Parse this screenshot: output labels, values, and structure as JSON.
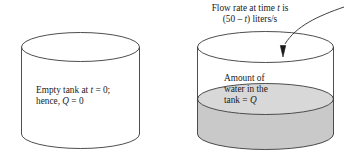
{
  "figure": {
    "kind": "diagram",
    "background_color": "#ffffff",
    "line_color": "#333333",
    "water_color": "#c9c9c9",
    "water_surface_color": "#d8d8d8"
  },
  "flow_label": {
    "line1_pre": "Flow rate at time ",
    "line1_var": "t",
    "line1_post": " is",
    "line2_pre": "(50 – ",
    "line2_var": "t",
    "line2_post": ") liters/s"
  },
  "left_tank": {
    "name": "empty-tank",
    "line1_pre": "Empty tank at ",
    "line1_var": "t",
    "line1_post": " = 0;",
    "line2_pre": "hence, ",
    "line2_var": "Q",
    "line2_post": " = 0"
  },
  "right_tank": {
    "name": "filling-tank",
    "line1": "Amount of",
    "line2": "water in the",
    "line3_pre": "tank = ",
    "line3_var": "Q"
  },
  "arrow": {
    "name": "flow-arrow",
    "direction": "down-into-tank"
  }
}
